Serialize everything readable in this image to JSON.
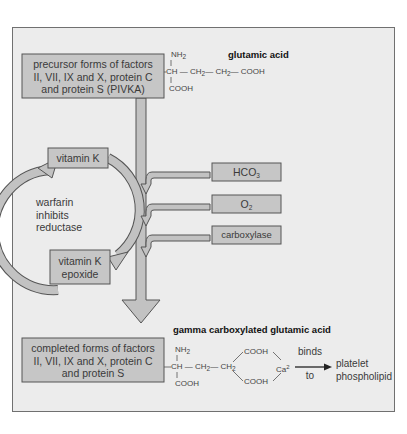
{
  "diagram": {
    "colors": {
      "background": "#ececec",
      "box_fill": "#c6c6c6",
      "box_stroke": "#555555",
      "arrow_fill": "#c2c2c2"
    },
    "precursor_box": {
      "lines": [
        "precursor forms of factors",
        "II, VII, IX and X, protein C",
        "and protein S (PIVKA)"
      ]
    },
    "glutamic_acid": {
      "title": "glutamic acid",
      "nh2": "NH",
      "nh2_sub": "2",
      "backbone": "CH — CH",
      "backbone_rest": "— CH",
      "cooh_end": "— COOH",
      "sub2": "2",
      "cooh": "COOH"
    },
    "cycle": {
      "vitamin_k": "vitamin K",
      "epoxide_lines": [
        "vitamin K",
        "epoxide"
      ],
      "warfarin_lines": [
        "warfarin",
        "inhibits",
        "reductase"
      ]
    },
    "cofactors": [
      {
        "label": "HCO",
        "sub": "3"
      },
      {
        "label": "O",
        "sub": "2"
      },
      {
        "label": "carboxylase",
        "sub": ""
      }
    ],
    "completed_box": {
      "lines": [
        "completed forms of factors",
        "II, VII, IX and X, protein C",
        "and protein S"
      ]
    },
    "gamma": {
      "title": "gamma carboxylated glutamic acid",
      "nh2": "NH",
      "nh2_sub": "2",
      "chain": "CH — CH",
      "chain2": "— CH",
      "sub2": "2",
      "cooh_top": "COOH",
      "cooh_bottom": "COOH",
      "cooh_alpha": "COOH",
      "ca": "Ca",
      "ca_sup": "2",
      "binds": "binds",
      "to": "to",
      "target_lines": [
        "platelet",
        "phospholipid"
      ]
    }
  }
}
